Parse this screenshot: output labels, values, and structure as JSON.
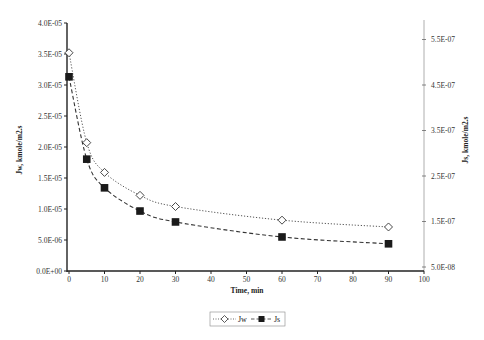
{
  "chart_data": {
    "type": "line",
    "title": "",
    "xlabel": "Time, min",
    "ylabel": "Jw, kmole/m2.s",
    "ylabel_right": "Js, kmole/m2.s",
    "xlim": [
      0,
      100
    ],
    "ylim": [
      0,
      4e-05
    ],
    "ylim_right": [
      5e-08,
      5.95e-07
    ],
    "x_ticks": [
      "0",
      "10",
      "20",
      "30",
      "40",
      "50",
      "60",
      "70",
      "80",
      "90",
      "100"
    ],
    "y_ticks": [
      "0.0E+00",
      "5.0E-06",
      "1.0E-05",
      "1.5E-05",
      "2.0E-05",
      "2.5E-05",
      "3.0E-05",
      "3.5E-05",
      "4.0E-05"
    ],
    "y_ticks_right": [
      "5.0E-08",
      "1.5E-07",
      "2.5E-07",
      "3.5E-07",
      "4.5E-07",
      "5.5E-07"
    ],
    "grid": false,
    "legend_position": "bottom",
    "x": [
      0,
      5,
      10,
      20,
      30,
      60,
      90
    ],
    "series": [
      {
        "name": "Jw",
        "axis": "left",
        "marker": "open-diamond",
        "line": "dotted",
        "values": [
          3.52e-05,
          2.07e-05,
          1.59e-05,
          1.22e-05,
          1.04e-05,
          8.2e-06,
          7.1e-06
        ]
      },
      {
        "name": "Js",
        "axis": "right",
        "marker": "filled-square",
        "line": "dashed",
        "values": [
          4.68e-07,
          2.87e-07,
          2.24e-07,
          1.73e-07,
          1.49e-07,
          1.16e-07,
          1.01e-07
        ]
      }
    ]
  },
  "legend": {
    "jw_label": "Jw",
    "js_label": "Js"
  }
}
